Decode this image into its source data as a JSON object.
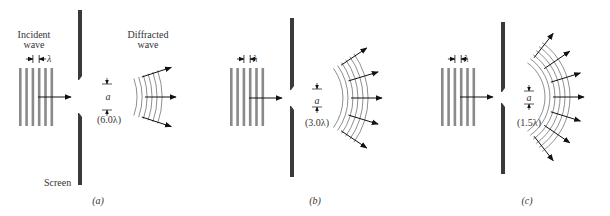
{
  "figure": {
    "colors": {
      "screen": "#3a3a3a",
      "incident_bar": "#8a8a8a",
      "arrow": "#111111",
      "wavefront": "#6a6a6a",
      "text": "#333333"
    },
    "labels": {
      "incident_wave_line1": "Incident",
      "incident_wave_line2": "wave",
      "diffracted_wave_line1": "Diffracted",
      "diffracted_wave_line2": "wave",
      "screen": "Screen",
      "wavelength_symbol": "λ",
      "slit_width_symbol": "a"
    },
    "panels": [
      {
        "id": "a",
        "caption": "(a)",
        "slit_width_label": "(6.0λ)",
        "slit_width_in_wavelengths": 6.0,
        "incident_wavefront_count": 6,
        "diffracted_arrow_count": 3
      },
      {
        "id": "b",
        "caption": "(b)",
        "slit_width_label": "(3.0λ)",
        "slit_width_in_wavelengths": 3.0,
        "incident_wavefront_count": 6,
        "diffracted_arrow_count": 5
      },
      {
        "id": "c",
        "caption": "(c)",
        "slit_width_label": "(1.5λ)",
        "slit_width_in_wavelengths": 1.5,
        "incident_wavefront_count": 6,
        "diffracted_arrow_count": 7
      }
    ]
  }
}
